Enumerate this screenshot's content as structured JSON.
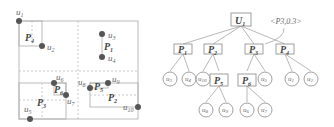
{
  "map": {
    "points": [
      {
        "id": "u1",
        "label": "u1",
        "x": 19,
        "y": 21,
        "lx": 22,
        "ly": 14
      },
      {
        "id": "u2",
        "label": "u2",
        "x": 42,
        "y": 46,
        "lx": 47,
        "ly": 50
      },
      {
        "id": "u3",
        "label": "u3",
        "x": 102,
        "y": 34,
        "lx": 108,
        "ly": 38
      },
      {
        "id": "u4",
        "label": "u4",
        "x": 102,
        "y": 57,
        "lx": 108,
        "ly": 61
      },
      {
        "id": "u5",
        "label": "u5",
        "x": 30,
        "y": 119,
        "lx": 25,
        "ly": 113
      },
      {
        "id": "u6",
        "label": "u6",
        "x": 54,
        "y": 83,
        "lx": 56,
        "ly": 80
      },
      {
        "id": "u7",
        "label": "u7",
        "x": 66,
        "y": 95,
        "lx": 67,
        "ly": 104
      },
      {
        "id": "u8",
        "label": "u8",
        "x": 90,
        "y": 88,
        "lx": 79,
        "ly": 85
      },
      {
        "id": "u9",
        "label": "u9",
        "x": 108,
        "y": 83,
        "lx": 112,
        "ly": 82
      },
      {
        "id": "u10",
        "label": "u10",
        "x": 138,
        "y": 107,
        "lx": 123,
        "ly": 110
      }
    ],
    "regions": [
      {
        "label": "P1",
        "x": 104,
        "y": 48
      },
      {
        "label": "P2",
        "x": 108,
        "y": 100
      },
      {
        "label": "P3",
        "x": 38,
        "y": 104
      },
      {
        "label": "P4",
        "x": 25,
        "y": 40
      },
      {
        "label": "P5",
        "x": 94,
        "y": 89
      },
      {
        "label": "P6",
        "x": 54,
        "y": 92
      }
    ]
  },
  "tree": {
    "root": "U1",
    "annotation": "<P3,0.3>",
    "level1": [
      "P1",
      "P2",
      "P3",
      "P4"
    ],
    "leaves": {
      "P1": [
        "u3",
        "u4"
      ],
      "P2": [
        "u10",
        "P5"
      ],
      "P3": [
        "P6",
        "u5"
      ],
      "P4": [
        "u1",
        "u2"
      ],
      "P5": [
        "u8",
        "u9"
      ],
      "P6": [
        "u6",
        "u7"
      ]
    }
  },
  "colors": {
    "point": "#555555",
    "line": "#999999",
    "dashed": "#bbbbbb",
    "text": "#555555"
  }
}
